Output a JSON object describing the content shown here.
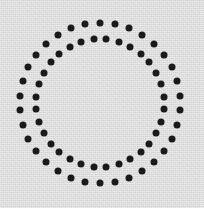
{
  "figure": {
    "width": 204,
    "height": 208,
    "background_color": "#dcdcdc",
    "has_texture": true,
    "texture_description": "fine light gray paper grain"
  },
  "chart_data": {
    "type": "scatter",
    "subtitle": "",
    "xlabel": "",
    "ylabel": "",
    "grid": false,
    "legend_position": "none",
    "xlim": [
      0,
      204
    ],
    "ylim": [
      0,
      208
    ],
    "axis_visible": false,
    "tick_labels_visible": false,
    "center": {
      "x": 100,
      "y": 103
    },
    "marker_shape": "circle",
    "marker_color": "#1a1a1a",
    "series": [
      {
        "name": "outer-ring",
        "ring_index": 0,
        "radius": 80,
        "count": 34,
        "dot_diameter": 7,
        "start_angle_deg": -90,
        "color": "#1a1a1a"
      },
      {
        "name": "inner-ring",
        "ring_index": 1,
        "radius": 64,
        "count": 32,
        "dot_diameter": 7,
        "start_angle_deg": -84.375,
        "color": "#1a1a1a"
      }
    ]
  }
}
